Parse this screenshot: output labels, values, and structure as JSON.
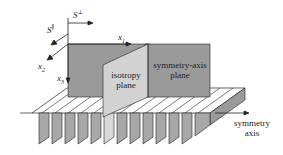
{
  "diagram": {
    "type": "3d-schematic",
    "colors": {
      "background": "#ffffff",
      "dark_plane": "#9a9a9a",
      "light_plane": "#d2d2d2",
      "fin": "#a8a8a8",
      "fin_light": "#d8d8d8",
      "line": "#222222"
    },
    "labels": {
      "s_perp": {
        "base": "S",
        "sup": "⊥"
      },
      "s_par": {
        "base": "S",
        "sup": "∥"
      },
      "x1": {
        "base": "x",
        "sub": "1"
      },
      "x2": {
        "base": "x",
        "sub": "2"
      },
      "x3": {
        "base": "x",
        "sub": "3"
      },
      "isotropy_plane": [
        "isotropy",
        "plane"
      ],
      "symmetry_axis_plane": [
        "symmetry-axis",
        "plane"
      ],
      "symmetry_axis": [
        "symmetry",
        "axis"
      ]
    }
  }
}
